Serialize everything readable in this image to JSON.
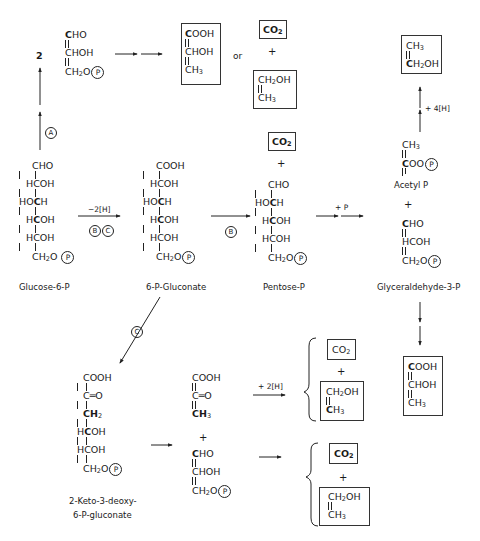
{
  "diagram": {
    "type": "metabolic-pathway",
    "labels": {
      "glucose6p": "Glucose-6-P",
      "gluconate": "6-P-Gluconate",
      "pentose": "Pentose-P",
      "glyceraldehyde": "Glyceraldehyde-3-P",
      "acetylp": "Acetyl P",
      "kdpg_1": "2-Keto-3-deoxy-",
      "kdpg_2": "6-P-gluconate"
    },
    "arrow_labels": {
      "path_a": "A",
      "path_b": "B",
      "path_c": "C",
      "oxidation": "−2[H]",
      "phosphate": "+ P",
      "reduction4": "+ 4[H]",
      "reduction2": "+ 2[H]",
      "coefficient": "2",
      "or": "or",
      "plus": "+"
    },
    "formulas": {
      "cho": "CHO",
      "chob": "C",
      "cooh": "COOH",
      "choh": "CHOH",
      "hcoh": "HCOH",
      "hoch": "HOCH",
      "ch2o": "CH",
      "ch3": "CH",
      "ch2oh": "CH",
      "co2": "CO",
      "keto": "C═O",
      "ch2": "CH",
      "coo": "COO",
      "p": "P",
      "sub2": "2",
      "sub3": "3",
      "o": "O",
      "oh": "OH",
      "ooh": "OOH",
      "ho": "HO",
      "h": "H",
      "c": "C"
    },
    "nodes": [
      {
        "id": "glucose-6-p",
        "name": "Glucose-6-P"
      },
      {
        "id": "6-p-gluconate",
        "name": "6-P-Gluconate"
      },
      {
        "id": "pentose-p",
        "name": "Pentose-P"
      },
      {
        "id": "acetyl-p",
        "name": "Acetyl P"
      },
      {
        "id": "glyceraldehyde-3-p",
        "name": "Glyceraldehyde-3-P"
      },
      {
        "id": "kdpg",
        "name": "2-Keto-3-deoxy-6-P-gluconate"
      },
      {
        "id": "lactate",
        "name": "COOH-CHOH-CH3 (boxed)"
      },
      {
        "id": "ethanol",
        "name": "CH2OH-CH3 (boxed)"
      },
      {
        "id": "co2",
        "name": "CO2 (boxed)"
      },
      {
        "id": "pyruvate",
        "name": "COOH-C=O-CH3"
      }
    ]
  }
}
